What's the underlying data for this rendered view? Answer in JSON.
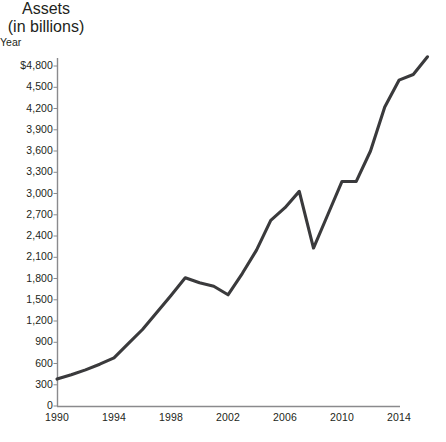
{
  "chart_data": {
    "type": "line",
    "title": "",
    "ylabel": "Assets\n(in billions)",
    "ylabel_line1": "Assets",
    "ylabel_line2": "(in billions)",
    "xlabel": "Year",
    "ylim": [
      0,
      5100
    ],
    "xlim": [
      1990,
      2016
    ],
    "grid": false,
    "legend": null,
    "line_color": "#3a3a3c",
    "axis_color": "#8a8a8d",
    "ytick_labels": [
      "$4,800",
      "4,500",
      "4,200",
      "3,900",
      "3,600",
      "3,300",
      "3,000",
      "2,700",
      "2,400",
      "2,100",
      "1,800",
      "1,500",
      "1,200",
      "900",
      "600",
      "300",
      "0"
    ],
    "ytick_values": [
      4800,
      4500,
      4200,
      3900,
      3600,
      3300,
      3000,
      2700,
      2400,
      2100,
      1800,
      1500,
      1200,
      900,
      600,
      300,
      0
    ],
    "xtick_labels": [
      "1990",
      "1994",
      "1998",
      "2002",
      "2006",
      "2010",
      "2014"
    ],
    "xtick_values": [
      1990,
      1994,
      1998,
      2002,
      2006,
      2010,
      2014
    ],
    "x": [
      1990,
      1991,
      1992,
      1993,
      1994,
      1995,
      1996,
      1997,
      1998,
      1999,
      2000,
      2001,
      2002,
      2003,
      2004,
      2005,
      2006,
      2007,
      2008,
      2009,
      2010,
      2011,
      2012,
      2013,
      2014,
      2015,
      2016
    ],
    "values": [
      380,
      440,
      510,
      590,
      680,
      880,
      1080,
      1320,
      1560,
      1810,
      1740,
      1690,
      1570,
      1870,
      2200,
      2620,
      2800,
      3030,
      2230,
      2700,
      3170,
      3170,
      3600,
      4220,
      4600,
      4680,
      4930
    ],
    "series": [
      {
        "name": "Assets",
        "values": [
          380,
          440,
          510,
          590,
          680,
          880,
          1080,
          1320,
          1560,
          1810,
          1740,
          1690,
          1570,
          1870,
          2200,
          2620,
          2800,
          3030,
          2230,
          2700,
          3170,
          3170,
          3600,
          4220,
          4600,
          4680,
          4930
        ]
      }
    ]
  }
}
